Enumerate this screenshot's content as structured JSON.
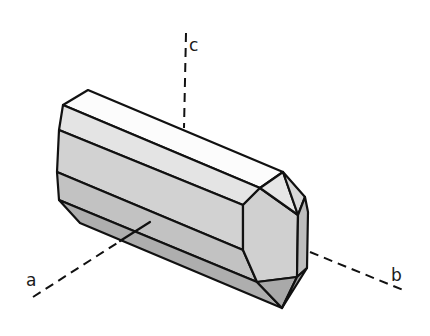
{
  "figure": {
    "type": "crystal-habit-diagram",
    "background": "#ffffff",
    "axes": [
      {
        "name": "c",
        "label": "c",
        "from": [
          186,
          33
        ],
        "to": [
          184,
          128
        ],
        "label_pos": [
          189,
          51
        ]
      },
      {
        "name": "a",
        "label": "a",
        "from": [
          33,
          297
        ],
        "to": [
          150,
          222
        ],
        "label_pos": [
          26,
          286
        ]
      },
      {
        "name": "b",
        "label": "b",
        "from": [
          310,
          252
        ],
        "to": [
          403,
          290
        ],
        "label_pos": [
          391,
          281
        ]
      }
    ],
    "faces": [
      {
        "name": "top-face",
        "fill": "#fcfcfc",
        "points": [
          [
            88,
            90
          ],
          [
            283,
            172
          ],
          [
            260,
            188
          ],
          [
            63,
            105
          ]
        ]
      },
      {
        "name": "upper-prism-face",
        "fill": "#e4e4e4",
        "points": [
          [
            63,
            105
          ],
          [
            260,
            188
          ],
          [
            243,
            205
          ],
          [
            59,
            130
          ]
        ]
      },
      {
        "name": "middle-prism-face",
        "fill": "#d2d2d2",
        "points": [
          [
            59,
            130
          ],
          [
            243,
            205
          ],
          [
            243,
            250
          ],
          [
            57,
            172
          ]
        ]
      },
      {
        "name": "lower-prism-face",
        "fill": "#c2c2c2",
        "points": [
          [
            57,
            172
          ],
          [
            243,
            250
          ],
          [
            257,
            282
          ],
          [
            59,
            200
          ]
        ]
      },
      {
        "name": "bottom-prism-face",
        "fill": "#aeaeae",
        "points": [
          [
            59,
            200
          ],
          [
            257,
            282
          ],
          [
            282,
            308
          ],
          [
            80,
            223
          ]
        ]
      },
      {
        "name": "end-front-face",
        "fill": "#d0d0d0",
        "points": [
          [
            260,
            188
          ],
          [
            298,
            215
          ],
          [
            297,
            277
          ],
          [
            257,
            282
          ],
          [
            243,
            250
          ],
          [
            243,
            205
          ]
        ]
      },
      {
        "name": "end-top-triangle",
        "fill": "#e6e6e6",
        "points": [
          [
            260,
            188
          ],
          [
            283,
            172
          ],
          [
            298,
            215
          ]
        ]
      },
      {
        "name": "end-top-right-facet",
        "fill": "#d8d8d8",
        "points": [
          [
            283,
            172
          ],
          [
            305,
            197
          ],
          [
            298,
            215
          ]
        ]
      },
      {
        "name": "end-right-strip",
        "fill": "#bdbdbd",
        "points": [
          [
            298,
            215
          ],
          [
            305,
            197
          ],
          [
            308,
            212
          ],
          [
            307,
            268
          ],
          [
            297,
            277
          ]
        ]
      },
      {
        "name": "end-bottom-triangle",
        "fill": "#a9a9a9",
        "points": [
          [
            257,
            282
          ],
          [
            297,
            277
          ],
          [
            282,
            308
          ]
        ]
      },
      {
        "name": "end-bottom-right-facet",
        "fill": "#9e9e9e",
        "points": [
          [
            297,
            277
          ],
          [
            307,
            268
          ],
          [
            282,
            308
          ]
        ]
      }
    ]
  }
}
